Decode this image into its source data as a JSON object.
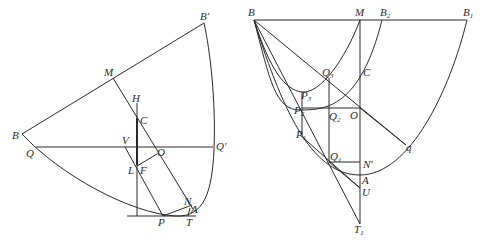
{
  "figure": {
    "panels": [
      {
        "id": "left",
        "description": "Parabola arc with chord BB', diameter through M, points C, H, V, O, L, F, N, A, P, T, Q, Q'",
        "labels": {
          "B_prime": "B′",
          "M": "M",
          "H": "H",
          "C": "C",
          "B": "B",
          "Q": "Q",
          "V": "V",
          "O": "O",
          "Q_prime": "Q′",
          "L": "L",
          "F": "F",
          "N": "N",
          "A": "A",
          "P": "P",
          "T": "T"
        }
      },
      {
        "id": "right",
        "description": "Nested parabolas through B with chord BB1, points M, B2, Q3, C, P3, P2, Q2, O, P1, Q1, N', q, A, U, T1",
        "labels": {
          "B": "B",
          "M": "M",
          "B2_base": "B",
          "B2_sub": "2",
          "B1_base": "B",
          "B1_sub": "1",
          "Q3_base": "Q",
          "Q3_sub": "3",
          "C": "C",
          "P3_base": "P",
          "P3_sub": "3",
          "P2_base": "P",
          "P2_sub": "2",
          "Q2_base": "Q",
          "Q2_sub": "2",
          "O": "O",
          "P1_base": "P",
          "P1_sub": "1",
          "Q1_base": "Q",
          "Q1_sub": "1",
          "N_prime": "N′",
          "q": "q",
          "A": "A",
          "U": "U",
          "T1_base": "T",
          "T1_sub": "1"
        }
      }
    ],
    "colors": {
      "stroke": "#2a2a2a",
      "background": "#ffffff"
    }
  }
}
